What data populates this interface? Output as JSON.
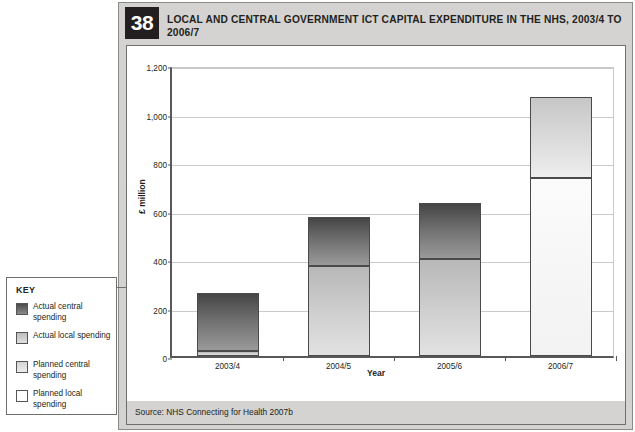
{
  "figure": {
    "number": "38",
    "title": "LOCAL AND CENTRAL GOVERNMENT ICT CAPITAL EXPENDITURE IN THE NHS, 2003/4 TO 2006/7",
    "source": "Source: NHS Connecting for Health 2007b"
  },
  "key": {
    "title": "KEY",
    "items": [
      {
        "label": "Actual central spending",
        "swatch": "dark-grey-gradient",
        "color": "#6e6e6e"
      },
      {
        "label": "Actual local spending",
        "swatch": "mid-grey-gradient",
        "color": "#d2d2d2"
      },
      {
        "label": "Planned central spending",
        "swatch": "light-grey-gradient",
        "color": "#dcdcdc"
      },
      {
        "label": "Planned local spending",
        "swatch": "white",
        "color": "#fbfbfb"
      }
    ]
  },
  "chart_data": {
    "type": "bar",
    "title": "LOCAL AND CENTRAL GOVERNMENT ICT CAPITAL EXPENDITURE IN THE NHS, 2003/4 TO 2006/7",
    "subtitle": "",
    "xlabel": "Year",
    "ylabel": "£ million",
    "ylim": [
      0,
      1200
    ],
    "yticks": [
      0,
      200,
      400,
      600,
      800,
      1000,
      1200
    ],
    "ytick_labels": [
      "0",
      "200",
      "400",
      "600",
      "800",
      "1,000",
      "1,200"
    ],
    "grid": true,
    "stacked": true,
    "legend_position": "left-outside",
    "categories": [
      "2003/4",
      "2004/5",
      "2005/6",
      "2006/7"
    ],
    "series": [
      {
        "name": "Actual local spending",
        "values": [
          20,
          370,
          400,
          null
        ]
      },
      {
        "name": "Actual central spending",
        "values": [
          240,
          205,
          230,
          null
        ]
      },
      {
        "name": "Planned local spending",
        "values": [
          null,
          null,
          null,
          735
        ]
      },
      {
        "name": "Planned central spending",
        "values": [
          null,
          null,
          null,
          335
        ]
      }
    ],
    "totals": [
      260,
      575,
      630,
      1070
    ],
    "annotations": []
  }
}
